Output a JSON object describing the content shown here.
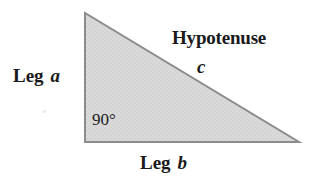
{
  "figure": {
    "background_color": "#ffffff",
    "triangle": {
      "name": "right-triangle",
      "fill_color": "#d9d9d9",
      "stroke_color": "#8c8c8c",
      "stroke_width": 2,
      "vertices": {
        "apex": [
          85,
          13
        ],
        "right_angle": [
          85,
          142
        ],
        "bottom_right": [
          299,
          142
        ]
      }
    },
    "labels": {
      "hypotenuse": "Hypotenuse",
      "hypotenuse_variable": "c",
      "leg_a_word": "Leg",
      "leg_a_variable": "a",
      "leg_b_word": "Leg",
      "leg_b_variable": "b",
      "right_angle": "90°"
    },
    "text_color": "#1a1a1a"
  }
}
